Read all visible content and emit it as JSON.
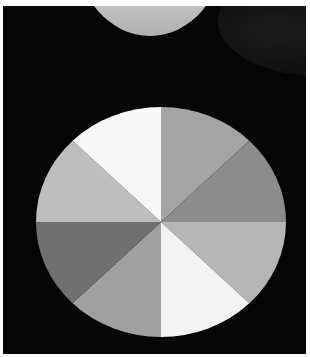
{
  "scene": {
    "description": "Photo of a black t-shirt with a large printed circle divided into eight grayscale wedges",
    "background_color": "#050505",
    "frame_color": "#ffffff",
    "neck_color": "#c8c8c8"
  },
  "pie_print": {
    "center": [
      128,
      115
    ],
    "radii": [
      125,
      115
    ],
    "segments": [
      {
        "position": "top-right-upper",
        "start_deg": -90,
        "end_deg": -45,
        "color": "#a4a4a4"
      },
      {
        "position": "right-upper",
        "start_deg": -45,
        "end_deg": 0,
        "color": "#8c8c8c"
      },
      {
        "position": "right-lower",
        "start_deg": 0,
        "end_deg": 45,
        "color": "#b6b6b6"
      },
      {
        "position": "bottom-right",
        "start_deg": 45,
        "end_deg": 90,
        "color": "#f3f3f3"
      },
      {
        "position": "bottom-left",
        "start_deg": 90,
        "end_deg": 135,
        "color": "#a0a0a0"
      },
      {
        "position": "left-lower",
        "start_deg": 135,
        "end_deg": 180,
        "color": "#707070"
      },
      {
        "position": "left-upper",
        "start_deg": 180,
        "end_deg": 225,
        "color": "#bebebe"
      },
      {
        "position": "top-left",
        "start_deg": 225,
        "end_deg": 270,
        "color": "#f7f7f7"
      }
    ]
  }
}
